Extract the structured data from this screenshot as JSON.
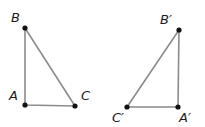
{
  "diagram": {
    "title": "",
    "colors": {
      "edge": "#8c8c8c",
      "point": "#111111",
      "label": "#1a1a1a",
      "background": "#ffffff"
    },
    "triangles": [
      {
        "name": "ABC",
        "vertices": [
          {
            "id": "A",
            "label": "A",
            "x": 25,
            "y": 105,
            "lx": 9,
            "ly": 100
          },
          {
            "id": "B",
            "label": "B",
            "x": 25,
            "y": 28,
            "lx": 11,
            "ly": 22
          },
          {
            "id": "C",
            "label": "C",
            "x": 75,
            "y": 106,
            "lx": 81,
            "ly": 100
          }
        ]
      },
      {
        "name": "A'B'C'",
        "vertices": [
          {
            "id": "A'",
            "label": "A′",
            "x": 178,
            "y": 107,
            "lx": 179,
            "ly": 122
          },
          {
            "id": "B'",
            "label": "B′",
            "x": 179,
            "y": 30,
            "lx": 160,
            "ly": 24
          },
          {
            "id": "C'",
            "label": "C′",
            "x": 127,
            "y": 107,
            "lx": 112,
            "ly": 122
          }
        ]
      }
    ]
  }
}
